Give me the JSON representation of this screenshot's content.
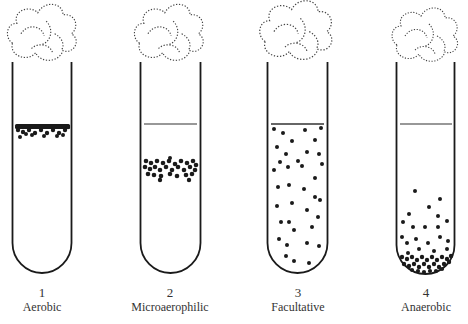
{
  "diagram": {
    "tubes": [
      {
        "number": "1",
        "label": "Aerobic",
        "distribution": "dense band at top surface"
      },
      {
        "number": "2",
        "label": "Microaerophilic",
        "distribution": "band slightly below surface"
      },
      {
        "number": "3",
        "label": "Facultative",
        "distribution": "scattered throughout"
      },
      {
        "number": "4",
        "label": "Anaerobic",
        "distribution": "concentrated at bottom"
      }
    ],
    "colors": {
      "ink": "#1a1a1a",
      "background": "#ffffff"
    }
  }
}
